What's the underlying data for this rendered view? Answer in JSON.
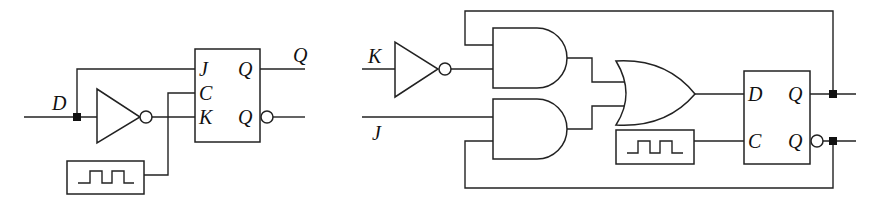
{
  "left_circuit": {
    "input_label": "D",
    "flipflop": {
      "type": "JK",
      "inputs": [
        "J",
        "C",
        "K"
      ],
      "outputs": [
        "Q",
        "Q"
      ],
      "output_label": "Q"
    },
    "gates": [
      "NOT"
    ],
    "clock": "clock-generator"
  },
  "right_circuit": {
    "input_labels": [
      "K",
      "J"
    ],
    "flipflop": {
      "type": "D",
      "inputs": [
        "D",
        "C"
      ],
      "outputs": [
        "Q",
        "Q"
      ]
    },
    "gates": [
      "NOT",
      "AND",
      "AND",
      "OR"
    ],
    "clock": "clock-generator"
  }
}
